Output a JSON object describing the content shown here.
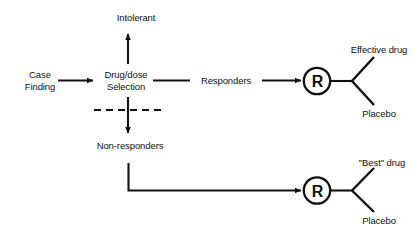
{
  "diagram": {
    "type": "flowchart",
    "nodes": {
      "case_finding": {
        "label": "Case\nFinding",
        "x": 40,
        "y": 80
      },
      "drug_dose_selection": {
        "label": "Drug/dose\nSelection",
        "x": 126,
        "y": 80
      },
      "intolerant": {
        "label": "Intolerant",
        "x": 136,
        "y": 17
      },
      "responders": {
        "label": "Responders",
        "x": 226,
        "y": 80
      },
      "non_responders": {
        "label": "Non-responders",
        "x": 130,
        "y": 145
      },
      "randomize_top": {
        "label": "R",
        "x": 317,
        "y": 81
      },
      "randomize_bottom": {
        "label": "R",
        "x": 317,
        "y": 190
      },
      "effective_drug": {
        "label": "Effective drug",
        "x": 379,
        "y": 49
      },
      "placebo_top": {
        "label": "Placebo",
        "x": 379,
        "y": 113
      },
      "best_drug": {
        "label": "\"Best\" drug",
        "x": 382,
        "y": 162
      },
      "placebo_bottom": {
        "label": "Placebo",
        "x": 379,
        "y": 220
      }
    },
    "edges": [
      {
        "name": "case-finding-to-selection",
        "from": "case_finding",
        "to": "drug_dose_selection",
        "style": "solid-arrow"
      },
      {
        "name": "selection-to-intolerant",
        "from": "drug_dose_selection",
        "to": "intolerant",
        "style": "solid-arrow"
      },
      {
        "name": "selection-to-responders",
        "from": "drug_dose_selection",
        "to": "randomize_top",
        "style": "solid-arrow"
      },
      {
        "name": "selection-to-non-responders",
        "from": "drug_dose_selection",
        "to": "non_responders",
        "style": "solid-arrow"
      },
      {
        "name": "non-responders-to-randomize",
        "from": "non_responders",
        "to": "randomize_bottom",
        "style": "elbow-arrow"
      },
      {
        "name": "randomize-top-fork",
        "from": "randomize_top",
        "to": [
          "effective_drug",
          "placebo_top"
        ],
        "style": "fork"
      },
      {
        "name": "randomize-bottom-fork",
        "from": "randomize_bottom",
        "to": [
          "best_drug",
          "placebo_bottom"
        ],
        "style": "fork"
      }
    ],
    "separator": {
      "name": "dashed-separator",
      "style": "dashed",
      "x1": 94,
      "x2": 161,
      "y": 110
    },
    "colors": {
      "stroke": "#111111",
      "text": "#111111",
      "background": "#ffffff"
    }
  }
}
